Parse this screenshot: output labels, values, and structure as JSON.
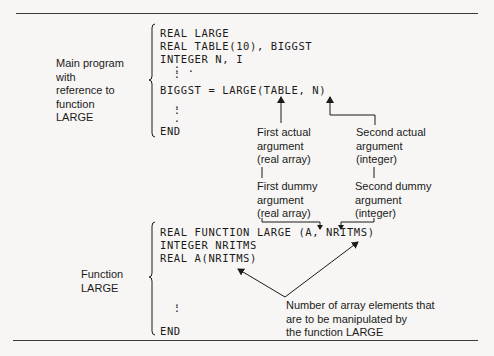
{
  "main_program": {
    "label_lines": [
      "Main program",
      "with",
      "reference to",
      "function",
      "LARGE"
    ],
    "code": [
      "REAL LARGE",
      "REAL TABLE(10), BIGGST",
      "INTEGER N, I",
      "  : .",
      "  :",
      "BIGGST = LARGE(TABLE, N)",
      "  .",
      "  :",
      "  .",
      "END"
    ]
  },
  "function_large": {
    "label_lines": [
      "Function",
      "LARGE"
    ],
    "code": [
      "REAL FUNCTION LARGE (A, NRITMS)",
      "INTEGER NRITMS",
      "REAL A(NRITMS)",
      "  .",
      "  :",
      "END"
    ]
  },
  "annotations": {
    "first_actual": [
      "First actual",
      "argument",
      "(real array)"
    ],
    "second_actual": [
      "Second actual",
      "argument",
      "(integer)"
    ],
    "first_dummy": [
      "First dummy",
      "argument",
      "(real array)"
    ],
    "second_dummy": [
      "Second dummy",
      "argument",
      "(integer)"
    ],
    "array_note": [
      "Number of array elements that",
      "are to be manipulated by",
      "the function LARGE"
    ]
  },
  "colors": {
    "background": "#f7f6f4",
    "ink": "#1a1a1a",
    "rule": "#3a3a3a"
  }
}
